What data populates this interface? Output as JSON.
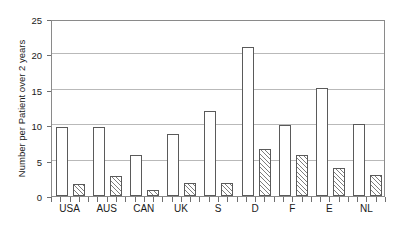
{
  "chart_data": {
    "type": "bar",
    "title": "",
    "xlabel": "",
    "ylabel": "Number per Patient over 2 years",
    "ylim": [
      0,
      25
    ],
    "yticks": [
      0,
      5,
      10,
      15,
      20,
      25
    ],
    "grid": true,
    "legend": "none",
    "categories": [
      "USA",
      "AUS",
      "CAN",
      "UK",
      "S",
      "D",
      "F",
      "E",
      "NL"
    ],
    "series": [
      {
        "name": "open-bar",
        "style": "white",
        "values": [
          9.8,
          9.8,
          5.8,
          8.8,
          12.0,
          21.0,
          10.0,
          15.2,
          10.2
        ]
      },
      {
        "name": "hatched-bar",
        "style": "hatched",
        "values": [
          1.7,
          2.8,
          0.8,
          1.8,
          1.9,
          6.7,
          5.8,
          3.9,
          3.0
        ]
      }
    ]
  },
  "colors": {
    "frame": "#8a8a8a",
    "gridline": "#b9b9b9",
    "bar_outline": "#5a5a5a",
    "bar_fill": "#ffffff",
    "hatch": "#7d7d7d",
    "text": "#1a1a1a"
  }
}
